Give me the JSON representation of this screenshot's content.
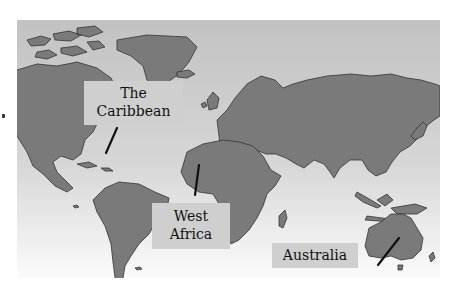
{
  "map": {
    "type": "world-map",
    "colors": {
      "land": "#7a7a7a",
      "ocean_top": "#c2c2c2",
      "ocean_bottom": "#fafafa",
      "coast": "#333333",
      "label_bg": "#cfcfcf"
    },
    "labels": [
      {
        "id": "caribbean",
        "line1": "The",
        "line2": "Caribbean"
      },
      {
        "id": "west_africa",
        "line1": "West",
        "line2": "Africa"
      },
      {
        "id": "australia",
        "line1": "Australia"
      }
    ]
  }
}
